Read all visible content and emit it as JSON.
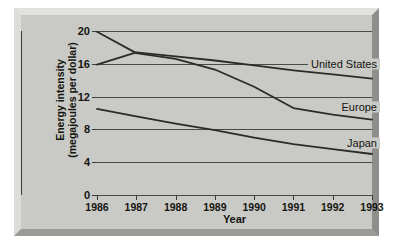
{
  "chart_data": {
    "type": "line",
    "title": "",
    "xlabel": "Year",
    "ylabel": "Energy intensity (megajoules per dollar)",
    "ylabel_line1": "Energy intensity",
    "ylabel_line2": "(megajoules per dollar)",
    "categories": [
      1986,
      1987,
      1988,
      1989,
      1990,
      1991,
      1992,
      1993
    ],
    "x_tick_labels": [
      "1986",
      "1987",
      "1988",
      "1989",
      "1990",
      "1991",
      "1992",
      "1993"
    ],
    "y_tick_labels": [
      "0",
      "4",
      "8",
      "12",
      "16",
      "20"
    ],
    "y_ticks": [
      0,
      4,
      8,
      12,
      16,
      20
    ],
    "ylim": [
      0,
      20
    ],
    "xlim": [
      1986,
      1993
    ],
    "grid": "horizontal",
    "legend": "inline-labels-right",
    "series": [
      {
        "name": "United States",
        "label": "United States",
        "color": "#2b2b29",
        "values": [
          15.9,
          17.4,
          16.9,
          16.4,
          15.8,
          15.2,
          14.7,
          14.2
        ]
      },
      {
        "name": "Europe",
        "label": "Europe",
        "color": "#2b2b29",
        "values": [
          19.9,
          17.3,
          16.6,
          15.3,
          13.2,
          10.6,
          9.8,
          9.2
        ]
      },
      {
        "name": "Japan",
        "label": "Japan",
        "color": "#2b2b29",
        "values": [
          10.5,
          9.6,
          8.7,
          7.9,
          7.0,
          6.2,
          5.6,
          5.0
        ]
      }
    ],
    "annotations": [
      {
        "text": "United States",
        "value": 16.0,
        "note": "label placed on the 16 gridline at right"
      },
      {
        "text": "Europe",
        "value": 10.7,
        "note": "label placed between the 12 and 8 gridlines at right"
      },
      {
        "text": "Japan",
        "value": 6.3,
        "note": "label placed between the 8 and 4 gridlines at right"
      }
    ],
    "colors": {
      "figure_background": "#c9c9c6",
      "axis": "#3b3b39",
      "gridline": "#4a4a48",
      "line": "#2b2b29",
      "text": "#15150f",
      "page_background": "#ffffff"
    }
  }
}
